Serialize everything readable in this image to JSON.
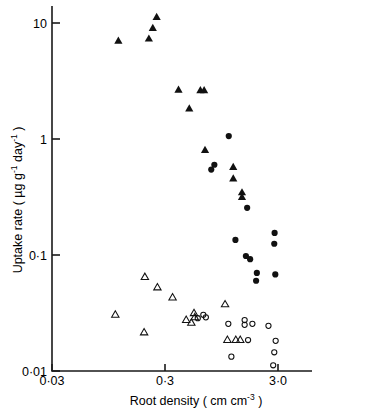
{
  "chart_data": {
    "type": "scatter",
    "title": "",
    "xlabel": "Root density ( cm cm-3 )",
    "xlabel_parts": {
      "main": "Root density ( cm cm",
      "sup": "-3",
      "tail": " )"
    },
    "ylabel": "Uptake rate ( µg g-1 day-1 )",
    "ylabel_parts": {
      "a": "Uptake rate ( ",
      "b": "µg g",
      "sup1": "-1",
      "c": " day",
      "sup2": "-1",
      "d": " )"
    },
    "xscale": "log",
    "yscale": "log",
    "xlim": [
      0.03,
      6.0
    ],
    "ylim": [
      0.01,
      14.0
    ],
    "xticks": [
      0.03,
      0.3,
      3.0
    ],
    "xticklabels": [
      "0·03",
      "0·3",
      "3·0"
    ],
    "yticks": [
      0.01,
      0.1,
      1,
      10
    ],
    "yticklabels": [
      "0·01",
      "0·1",
      "1",
      "10"
    ],
    "grid": false,
    "legend": "none",
    "series": [
      {
        "name": "filled-triangle",
        "marker": "triangle",
        "fill": "solid",
        "color": "#111111",
        "points": [
          [
            0.116,
            7.0
          ],
          [
            0.216,
            7.3
          ],
          [
            0.234,
            9.0
          ],
          [
            0.253,
            11.2
          ],
          [
            0.395,
            2.65
          ],
          [
            0.617,
            2.62
          ],
          [
            0.666,
            2.62
          ],
          [
            0.492,
            1.82
          ],
          [
            0.678,
            0.8
          ],
          [
            1.205,
            0.57
          ],
          [
            1.205,
            0.455
          ],
          [
            1.44,
            0.345
          ],
          [
            1.44,
            0.315
          ]
        ]
      },
      {
        "name": "filled-circle",
        "marker": "circle",
        "fill": "solid",
        "color": "#111111",
        "points": [
          [
            1.1,
            1.06
          ],
          [
            0.82,
            0.6
          ],
          [
            0.77,
            0.545
          ],
          [
            1.6,
            0.255
          ],
          [
            1.26,
            0.135
          ],
          [
            2.8,
            0.155
          ],
          [
            2.78,
            0.125
          ],
          [
            1.56,
            0.098
          ],
          [
            1.7,
            0.092
          ],
          [
            1.95,
            0.07
          ],
          [
            2.84,
            0.068
          ],
          [
            1.92,
            0.06
          ]
        ]
      },
      {
        "name": "open-triangle",
        "marker": "triangle",
        "fill": "open",
        "color": "#111111",
        "points": [
          [
            0.109,
            0.0305
          ],
          [
            0.196,
            0.0215
          ],
          [
            0.199,
            0.0645
          ],
          [
            0.257,
            0.0525
          ],
          [
            0.35,
            0.043
          ],
          [
            0.462,
            0.0275
          ],
          [
            0.542,
            0.0315
          ],
          [
            0.55,
            0.029
          ],
          [
            0.513,
            0.026
          ],
          [
            1.02,
            0.0375
          ],
          [
            1.07,
            0.0185
          ],
          [
            1.27,
            0.0185
          ],
          [
            1.39,
            0.0185
          ]
        ]
      },
      {
        "name": "open-circle",
        "marker": "circle",
        "fill": "open",
        "color": "#111111",
        "points": [
          [
            0.585,
            0.0285
          ],
          [
            0.655,
            0.0305
          ],
          [
            0.69,
            0.029
          ],
          [
            1.09,
            0.0255
          ],
          [
            1.52,
            0.0275
          ],
          [
            1.52,
            0.025
          ],
          [
            1.78,
            0.0255
          ],
          [
            2.47,
            0.0245
          ],
          [
            1.63,
            0.0185
          ],
          [
            2.86,
            0.0182
          ],
          [
            1.16,
            0.0133
          ],
          [
            2.78,
            0.0145
          ],
          [
            2.72,
            0.0112
          ]
        ]
      }
    ]
  }
}
